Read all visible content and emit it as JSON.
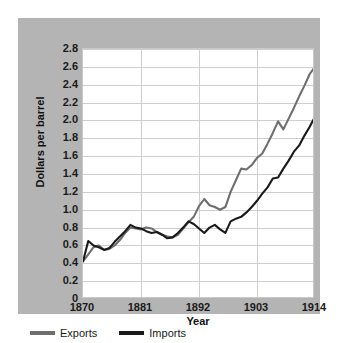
{
  "chart_data": {
    "type": "line",
    "title": "",
    "xlabel": "Year",
    "ylabel": "Dollars per barrel",
    "xlim": [
      1870,
      1914
    ],
    "ylim": [
      0,
      2.8
    ],
    "grid": true,
    "legend_position": "bottom-left",
    "x_ticks": [
      "1870",
      "1881",
      "1892",
      "1903",
      "1914"
    ],
    "x_tick_values": [
      1870,
      1881,
      1892,
      1903,
      1914
    ],
    "y_ticks": [
      "2.8",
      "2.6",
      "2.4",
      "2.2",
      "2.0",
      "1.8",
      "1.6",
      "1.4",
      "1.2",
      "1.0",
      "0.8",
      "0.6",
      "0.4",
      "0.2",
      "0"
    ],
    "y_tick_values": [
      2.8,
      2.6,
      2.4,
      2.2,
      2.0,
      1.8,
      1.6,
      1.4,
      1.2,
      1.0,
      0.8,
      0.6,
      0.4,
      0.2,
      0
    ],
    "x": [
      1870,
      1871,
      1872,
      1873,
      1874,
      1875,
      1876,
      1877,
      1878,
      1879,
      1880,
      1881,
      1882,
      1883,
      1884,
      1885,
      1886,
      1887,
      1888,
      1889,
      1890,
      1891,
      1892,
      1893,
      1894,
      1895,
      1896,
      1897,
      1898,
      1899,
      1900,
      1901,
      1902,
      1903,
      1904,
      1905,
      1906,
      1907,
      1908,
      1909,
      1910,
      1911,
      1912,
      1913,
      1914
    ],
    "series": [
      {
        "name": "Exports",
        "color": "#6e6e6e",
        "values": [
          0.42,
          0.5,
          0.58,
          0.6,
          0.55,
          0.56,
          0.6,
          0.66,
          0.74,
          0.8,
          0.79,
          0.78,
          0.8,
          0.79,
          0.75,
          0.72,
          0.7,
          0.69,
          0.72,
          0.79,
          0.86,
          0.92,
          1.04,
          1.12,
          1.05,
          1.03,
          1.0,
          1.03,
          1.2,
          1.33,
          1.46,
          1.45,
          1.5,
          1.58,
          1.63,
          1.74,
          1.86,
          1.99,
          1.9,
          2.02,
          2.14,
          2.27,
          2.39,
          2.52,
          2.6
        ]
      },
      {
        "name": "Imports",
        "color": "#1a1a1a",
        "values": [
          0.42,
          0.65,
          0.6,
          0.58,
          0.55,
          0.57,
          0.64,
          0.7,
          0.76,
          0.83,
          0.8,
          0.79,
          0.76,
          0.74,
          0.75,
          0.72,
          0.68,
          0.69,
          0.74,
          0.8,
          0.87,
          0.84,
          0.79,
          0.74,
          0.8,
          0.83,
          0.78,
          0.74,
          0.87,
          0.9,
          0.92,
          0.97,
          1.03,
          1.1,
          1.18,
          1.25,
          1.35,
          1.36,
          1.46,
          1.55,
          1.65,
          1.72,
          1.83,
          1.93,
          2.04
        ]
      }
    ]
  },
  "legend": {
    "items": [
      {
        "label": "Exports",
        "color": "#6e6e6e"
      },
      {
        "label": "Imports",
        "color": "#1a1a1a"
      }
    ]
  }
}
